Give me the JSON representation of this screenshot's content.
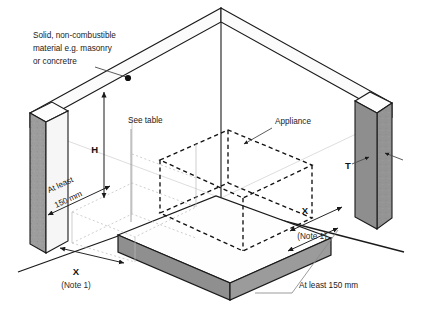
{
  "figure": {
    "type": "isometric-technical-diagram"
  },
  "callouts": {
    "material": {
      "line1": "Solid, non-combustible",
      "line2": "material e.g. masonry",
      "line3": "or concretre"
    },
    "see_table": "See table",
    "appliance": "Appliance"
  },
  "dimensions": {
    "height_label": "H",
    "thickness_label": "T",
    "x_left": {
      "label": "X",
      "note": "(Note 1)"
    },
    "x_right": {
      "label": "X",
      "note": "(Note 1)"
    },
    "hearth_side": {
      "line1": "At least",
      "line2": "150 mm"
    },
    "hearth_front": "At least 150 mm"
  },
  "colors": {
    "wall_face_shaded": "#9a9a9a",
    "wall_face_light": "#f2f2f2",
    "hearth_top": "#ffffff",
    "hearth_side": "#909090",
    "outline": "#1a1a1a",
    "dashed_appliance": "#111111",
    "leader": "#555555",
    "background": "#ffffff"
  }
}
